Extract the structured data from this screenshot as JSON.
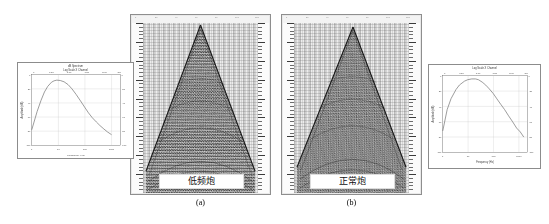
{
  "figure": {
    "caption_a": "(a)",
    "caption_b": "(b)",
    "panel_a_label": "低频炮",
    "panel_b_label": "正常炮",
    "background_color": "#ffffff",
    "panel_border_color": "#8e8e8e"
  },
  "panel_a": {
    "name": "低频炮",
    "type": "seismic-shot-gather",
    "header_labels": [
      "1",
      "20",
      "40",
      "60",
      "80",
      "100",
      "120"
    ],
    "ruler_unit": "ms",
    "ruler_major_count": 9,
    "ruler_minor_count": 45
  },
  "panel_b": {
    "name": "正常炮",
    "type": "seismic-shot-gather",
    "header_labels": [
      "1",
      "20",
      "40",
      "60",
      "80",
      "100",
      "120"
    ],
    "ruler_unit": "ms",
    "ruler_major_count": 9,
    "ruler_minor_count": 45
  },
  "chart_data": [
    {
      "id": "spectrum-low-frequency",
      "type": "line",
      "title": "dB Spectrum",
      "subtitle": "Log Scale X Channel",
      "xlabel": "Frequency (Hz)",
      "ylabel": "Amplitude (dB)",
      "xscale": "log",
      "xlim": [
        1,
        1000
      ],
      "ylim": [
        -100,
        0
      ],
      "xticks": [
        1,
        10,
        100,
        1000
      ],
      "xticklabels": [
        "1",
        "10",
        "100",
        "1000"
      ],
      "top_xticks": [
        "0",
        "0.50",
        "1.00",
        "1.50",
        "2.00",
        "2.5"
      ],
      "yticks": [
        -100,
        -80,
        -60,
        -40,
        -20,
        0
      ],
      "yticklabels": [
        "-100",
        "-80",
        "-60",
        "-40",
        "-20",
        "0"
      ],
      "right_yticklabels": [
        "-100",
        "-80",
        "-60",
        "-40",
        "-20",
        "0"
      ],
      "grid": true,
      "legend": "none",
      "series": [
        {
          "name": "Amplitude spectrum",
          "x": [
            1,
            1.6,
            2.2,
            3,
            4,
            5.5,
            7,
            9,
            12,
            16,
            22,
            30,
            42,
            60,
            85,
            120,
            170,
            240,
            340,
            500,
            700,
            1000
          ],
          "values": [
            -78,
            -52,
            -34,
            -22,
            -15,
            -11,
            -9,
            -8,
            -8.5,
            -10,
            -14,
            -20,
            -28,
            -37,
            -46,
            -54,
            -61,
            -67,
            -72,
            -77,
            -81,
            -85
          ]
        }
      ]
    },
    {
      "id": "spectrum-normal",
      "type": "line",
      "title": "Log Scale X Channel",
      "subtitle": "",
      "xlabel": "Frequency (Hz)",
      "ylabel": "Amplitude (dB)",
      "xscale": "log",
      "xlim": [
        1,
        1000
      ],
      "ylim": [
        -100,
        0
      ],
      "xticks": [
        1,
        10,
        100,
        1000
      ],
      "xticklabels": [
        "1",
        "10",
        "100",
        "1000"
      ],
      "top_xticks": [
        "0",
        "0.50",
        "1.00",
        "1.50",
        "2.00",
        "2.5"
      ],
      "yticks": [
        -100,
        -80,
        -60,
        -40,
        -20,
        0
      ],
      "yticklabels": [
        "-100",
        "-80",
        "-60",
        "-40",
        "-20",
        "0"
      ],
      "right_yticklabels": [
        "-100",
        "-80",
        "-60",
        "-40",
        "-20",
        "0"
      ],
      "grid": true,
      "legend": "none",
      "series": [
        {
          "name": "Amplitude spectrum",
          "x": [
            1,
            1.5,
            2,
            3,
            4,
            6,
            8,
            11,
            15,
            20,
            28,
            38,
            52,
            72,
            100,
            140,
            200,
            280,
            400,
            560,
            780,
            1000
          ],
          "values": [
            -72,
            -44,
            -30,
            -18,
            -12,
            -8,
            -6,
            -5,
            -5,
            -6,
            -9,
            -13,
            -18,
            -24,
            -31,
            -38,
            -45,
            -53,
            -61,
            -69,
            -74,
            -80
          ]
        }
      ]
    }
  ]
}
